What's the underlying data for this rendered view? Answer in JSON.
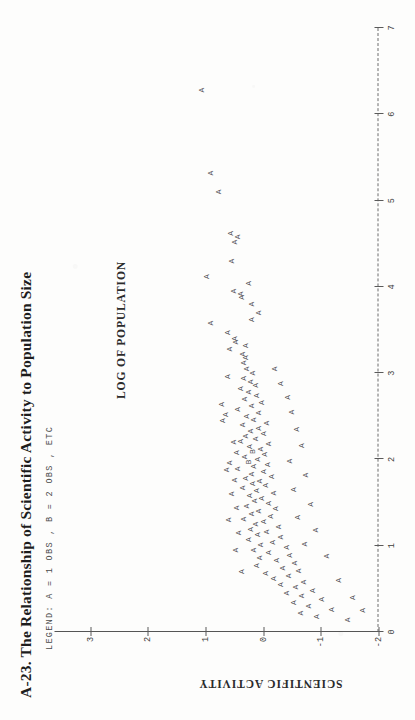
{
  "figure": {
    "number": "A-23.",
    "title": "A-23.  The Relationship of Scientific Activity to Population Size",
    "legend": "LEGEND:  A = 1 OBS ,  B = 2 OBS ,  ETC"
  },
  "chart_data": {
    "type": "scatter",
    "title": "A-23.  The Relationship of Scientific Activity to Population Size",
    "xlabel": "LOG OF POPULATION",
    "ylabel": "SCIENTIFIC ACTIVITY",
    "xlim": [
      0,
      7
    ],
    "ylim": [
      -2,
      3.2
    ],
    "xticks": [
      0,
      1,
      2,
      3,
      4,
      5,
      6,
      7
    ],
    "xticklabels": [
      "0",
      "1",
      "2",
      "3",
      "4",
      "5",
      "6",
      "7"
    ],
    "yticks": [
      -2,
      -1,
      0,
      1,
      2,
      3
    ],
    "yticklabels": [
      "-2",
      "-1",
      "0",
      "1",
      "2",
      "3"
    ],
    "grid": false,
    "legend_position": "none",
    "marker_legend": [
      {
        "glyph": "A",
        "count": 1,
        "text": "A = 1 OBS"
      },
      {
        "glyph": "B",
        "count": 2,
        "text": "B = 2 OBS"
      },
      {
        "glyph": "ETC",
        "count": null,
        "text": "ETC"
      }
    ],
    "points": [
      {
        "x": 6.28,
        "y": 1.07,
        "m": "A"
      },
      {
        "x": 5.32,
        "y": 0.92,
        "m": "A"
      },
      {
        "x": 5.1,
        "y": 0.78,
        "m": "A"
      },
      {
        "x": 4.62,
        "y": 0.56,
        "m": "A"
      },
      {
        "x": 4.58,
        "y": 0.45,
        "m": "A"
      },
      {
        "x": 4.52,
        "y": 0.49,
        "m": "A"
      },
      {
        "x": 4.3,
        "y": 0.55,
        "m": "A"
      },
      {
        "x": 4.12,
        "y": 0.98,
        "m": "A"
      },
      {
        "x": 4.04,
        "y": 0.26,
        "m": "A"
      },
      {
        "x": 3.95,
        "y": 0.52,
        "m": "A"
      },
      {
        "x": 3.92,
        "y": 0.4,
        "m": "A"
      },
      {
        "x": 3.88,
        "y": 0.38,
        "m": "A"
      },
      {
        "x": 3.8,
        "y": 0.2,
        "m": "A"
      },
      {
        "x": 3.58,
        "y": 0.92,
        "m": "A"
      },
      {
        "x": 3.47,
        "y": 0.62,
        "m": "A"
      },
      {
        "x": 3.4,
        "y": 0.5,
        "m": "A"
      },
      {
        "x": 3.36,
        "y": 0.48,
        "m": "A"
      },
      {
        "x": 3.32,
        "y": 0.3,
        "m": "A"
      },
      {
        "x": 3.28,
        "y": 0.58,
        "m": "A"
      },
      {
        "x": 3.22,
        "y": 0.36,
        "m": "A"
      },
      {
        "x": 3.18,
        "y": 0.3,
        "m": "A"
      },
      {
        "x": 3.12,
        "y": 0.34,
        "m": "A"
      },
      {
        "x": 3.05,
        "y": 0.28,
        "m": "A"
      },
      {
        "x": 3.0,
        "y": 0.18,
        "m": "A"
      },
      {
        "x": 2.96,
        "y": 0.62,
        "m": "A"
      },
      {
        "x": 2.94,
        "y": 0.34,
        "m": "A"
      },
      {
        "x": 2.9,
        "y": 0.22,
        "m": "A"
      },
      {
        "x": 2.86,
        "y": 0.14,
        "m": "A"
      },
      {
        "x": 2.82,
        "y": 0.4,
        "m": "A"
      },
      {
        "x": 2.78,
        "y": 0.26,
        "m": "A"
      },
      {
        "x": 2.74,
        "y": 0.12,
        "m": "A"
      },
      {
        "x": 2.7,
        "y": 0.33,
        "m": "A"
      },
      {
        "x": 2.66,
        "y": 0.02,
        "m": "A"
      },
      {
        "x": 2.62,
        "y": 0.2,
        "m": "A"
      },
      {
        "x": 2.58,
        "y": 0.45,
        "m": "A"
      },
      {
        "x": 2.54,
        "y": 0.08,
        "m": "A"
      },
      {
        "x": 2.5,
        "y": 0.28,
        "m": "A"
      },
      {
        "x": 2.46,
        "y": 0.16,
        "m": "A"
      },
      {
        "x": 2.42,
        "y": -0.05,
        "m": "A"
      },
      {
        "x": 2.4,
        "y": 0.36,
        "m": "A"
      },
      {
        "x": 2.36,
        "y": 0.08,
        "m": "A"
      },
      {
        "x": 2.33,
        "y": 0.22,
        "m": "A"
      },
      {
        "x": 2.3,
        "y": 0.0,
        "m": "A"
      },
      {
        "x": 2.27,
        "y": 0.3,
        "m": "A"
      },
      {
        "x": 2.24,
        "y": 0.13,
        "m": "A"
      },
      {
        "x": 2.21,
        "y": 0.4,
        "m": "A"
      },
      {
        "x": 2.18,
        "y": -0.1,
        "m": "A"
      },
      {
        "x": 2.15,
        "y": 0.24,
        "m": "A"
      },
      {
        "x": 2.12,
        "y": 0.05,
        "m": "A"
      },
      {
        "x": 2.09,
        "y": 0.18,
        "m": "B"
      },
      {
        "x": 2.06,
        "y": -0.02,
        "m": "A"
      },
      {
        "x": 2.03,
        "y": 0.33,
        "m": "A"
      },
      {
        "x": 2.0,
        "y": 0.1,
        "m": "A"
      },
      {
        "x": 1.97,
        "y": 0.26,
        "m": "B"
      },
      {
        "x": 1.94,
        "y": -0.08,
        "m": "A"
      },
      {
        "x": 1.92,
        "y": 0.16,
        "m": "A"
      },
      {
        "x": 1.89,
        "y": 0.44,
        "m": "A"
      },
      {
        "x": 1.86,
        "y": 0.0,
        "m": "A"
      },
      {
        "x": 1.83,
        "y": 0.21,
        "m": "A"
      },
      {
        "x": 1.8,
        "y": -0.14,
        "m": "A"
      },
      {
        "x": 1.78,
        "y": 0.3,
        "m": "A"
      },
      {
        "x": 1.75,
        "y": 0.06,
        "m": "A"
      },
      {
        "x": 1.72,
        "y": 0.18,
        "m": "A"
      },
      {
        "x": 1.7,
        "y": -0.04,
        "m": "A"
      },
      {
        "x": 1.67,
        "y": 0.36,
        "m": "A"
      },
      {
        "x": 1.64,
        "y": 0.12,
        "m": "A"
      },
      {
        "x": 1.61,
        "y": -0.18,
        "m": "A"
      },
      {
        "x": 1.58,
        "y": 0.24,
        "m": "A"
      },
      {
        "x": 1.55,
        "y": 0.02,
        "m": "A"
      },
      {
        "x": 1.52,
        "y": 0.15,
        "m": "A"
      },
      {
        "x": 1.49,
        "y": -0.09,
        "m": "A"
      },
      {
        "x": 1.46,
        "y": 0.28,
        "m": "A"
      },
      {
        "x": 1.43,
        "y": -0.22,
        "m": "A"
      },
      {
        "x": 1.4,
        "y": 0.08,
        "m": "A"
      },
      {
        "x": 1.37,
        "y": 0.2,
        "m": "A"
      },
      {
        "x": 1.34,
        "y": -0.12,
        "m": "A"
      },
      {
        "x": 1.31,
        "y": 0.34,
        "m": "A"
      },
      {
        "x": 1.28,
        "y": -0.01,
        "m": "A"
      },
      {
        "x": 1.25,
        "y": 0.14,
        "m": "A"
      },
      {
        "x": 1.22,
        "y": -0.26,
        "m": "A"
      },
      {
        "x": 1.19,
        "y": 0.22,
        "m": "A"
      },
      {
        "x": 1.16,
        "y": -0.06,
        "m": "A"
      },
      {
        "x": 1.13,
        "y": 0.1,
        "m": "A"
      },
      {
        "x": 1.1,
        "y": -0.3,
        "m": "A"
      },
      {
        "x": 1.07,
        "y": 0.26,
        "m": "A"
      },
      {
        "x": 1.04,
        "y": -0.16,
        "m": "A"
      },
      {
        "x": 1.01,
        "y": 0.04,
        "m": "A"
      },
      {
        "x": 0.98,
        "y": -0.4,
        "m": "A"
      },
      {
        "x": 0.95,
        "y": 0.17,
        "m": "A"
      },
      {
        "x": 0.92,
        "y": -0.1,
        "m": "A"
      },
      {
        "x": 0.89,
        "y": -0.46,
        "m": "A"
      },
      {
        "x": 0.86,
        "y": 0.06,
        "m": "A"
      },
      {
        "x": 0.83,
        "y": -0.24,
        "m": "A"
      },
      {
        "x": 0.8,
        "y": -0.55,
        "m": "A"
      },
      {
        "x": 0.77,
        "y": 0.12,
        "m": "A"
      },
      {
        "x": 0.74,
        "y": -0.34,
        "m": "A"
      },
      {
        "x": 0.71,
        "y": -0.62,
        "m": "A"
      },
      {
        "x": 0.68,
        "y": -0.04,
        "m": "A"
      },
      {
        "x": 0.65,
        "y": -0.44,
        "m": "A"
      },
      {
        "x": 0.62,
        "y": -0.18,
        "m": "A"
      },
      {
        "x": 0.58,
        "y": -0.7,
        "m": "A"
      },
      {
        "x": 0.55,
        "y": -0.3,
        "m": "A"
      },
      {
        "x": 0.52,
        "y": -0.56,
        "m": "A"
      },
      {
        "x": 0.48,
        "y": -0.86,
        "m": "A"
      },
      {
        "x": 0.45,
        "y": -0.4,
        "m": "A"
      },
      {
        "x": 0.42,
        "y": -0.66,
        "m": "A"
      },
      {
        "x": 0.38,
        "y": -1.02,
        "m": "A"
      },
      {
        "x": 0.34,
        "y": -0.52,
        "m": "A"
      },
      {
        "x": 0.3,
        "y": -0.78,
        "m": "A"
      },
      {
        "x": 0.26,
        "y": -1.18,
        "m": "A"
      },
      {
        "x": 0.22,
        "y": -0.64,
        "m": "A"
      },
      {
        "x": 0.18,
        "y": -0.92,
        "m": "A"
      },
      {
        "x": 0.14,
        "y": -1.46,
        "m": "A"
      },
      {
        "x": 2.45,
        "y": 0.7,
        "m": "A"
      },
      {
        "x": 2.52,
        "y": 0.66,
        "m": "A"
      },
      {
        "x": 2.64,
        "y": 0.72,
        "m": "A"
      },
      {
        "x": 2.2,
        "y": 0.52,
        "m": "A"
      },
      {
        "x": 2.08,
        "y": 0.46,
        "m": "A"
      },
      {
        "x": 1.96,
        "y": 0.58,
        "m": "A"
      },
      {
        "x": 1.88,
        "y": 0.64,
        "m": "A"
      },
      {
        "x": 1.76,
        "y": 0.5,
        "m": "A"
      },
      {
        "x": 1.6,
        "y": 0.54,
        "m": "A"
      },
      {
        "x": 1.44,
        "y": 0.46,
        "m": "A"
      },
      {
        "x": 1.3,
        "y": 0.6,
        "m": "A"
      },
      {
        "x": 1.15,
        "y": 0.42,
        "m": "A"
      },
      {
        "x": 0.95,
        "y": 0.48,
        "m": "A"
      },
      {
        "x": 0.7,
        "y": 0.38,
        "m": "A"
      },
      {
        "x": 3.62,
        "y": 0.2,
        "m": "A"
      },
      {
        "x": 3.7,
        "y": 0.08,
        "m": "A"
      },
      {
        "x": 3.05,
        "y": -0.2,
        "m": "A"
      },
      {
        "x": 2.88,
        "y": -0.3,
        "m": "A"
      },
      {
        "x": 2.72,
        "y": -0.42,
        "m": "A"
      },
      {
        "x": 2.55,
        "y": -0.5,
        "m": "A"
      },
      {
        "x": 2.35,
        "y": -0.58,
        "m": "A"
      },
      {
        "x": 2.16,
        "y": -0.66,
        "m": "A"
      },
      {
        "x": 1.98,
        "y": -0.46,
        "m": "A"
      },
      {
        "x": 1.82,
        "y": -0.74,
        "m": "A"
      },
      {
        "x": 1.65,
        "y": -0.52,
        "m": "A"
      },
      {
        "x": 1.48,
        "y": -0.82,
        "m": "A"
      },
      {
        "x": 1.33,
        "y": -0.6,
        "m": "A"
      },
      {
        "x": 1.18,
        "y": -0.9,
        "m": "A"
      },
      {
        "x": 1.02,
        "y": -0.72,
        "m": "A"
      },
      {
        "x": 0.88,
        "y": -1.1,
        "m": "A"
      },
      {
        "x": 0.6,
        "y": -1.3,
        "m": "A"
      },
      {
        "x": 0.4,
        "y": -1.55,
        "m": "A"
      },
      {
        "x": 0.25,
        "y": -1.72,
        "m": "A"
      }
    ]
  }
}
